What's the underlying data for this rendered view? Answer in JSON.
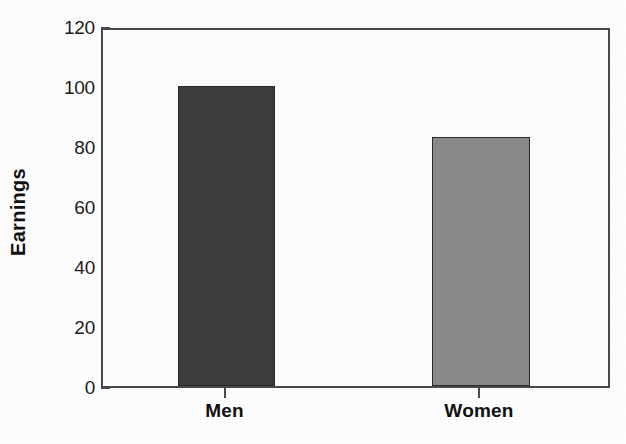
{
  "chart_data": {
    "type": "bar",
    "title": "",
    "subtitle": "",
    "xlabel": "",
    "ylabel": "Earnings",
    "categories": [
      "Men",
      "Women"
    ],
    "values": [
      100,
      83
    ],
    "series": [
      {
        "name": "Earnings",
        "values": [
          100,
          83
        ]
      }
    ],
    "ylim": [
      0,
      120
    ],
    "y_ticks": [
      0,
      20,
      40,
      60,
      80,
      100,
      120
    ],
    "y_tick_labels": [
      "0",
      "20",
      "40",
      "60",
      "80",
      "100",
      "120"
    ],
    "x_tick_labels": [
      "Men",
      "Women"
    ],
    "grid": false,
    "legend": false,
    "legend_position": "none",
    "bar_colors": [
      "#3d3d3d",
      "#8a8a8a"
    ],
    "bar_border_color": "#2a2a2a",
    "axis_color": "#4a4a4a",
    "background_color": "#fdfdfd",
    "text_color": "#111111",
    "annotations": []
  },
  "axes": {
    "y_title": "Earnings",
    "y_ticks": [
      {
        "value": 120,
        "label": "120"
      },
      {
        "value": 100,
        "label": "100"
      },
      {
        "value": 80,
        "label": "80"
      },
      {
        "value": 60,
        "label": "60"
      },
      {
        "value": 40,
        "label": "40"
      },
      {
        "value": 20,
        "label": "20"
      },
      {
        "value": 0,
        "label": "0"
      }
    ],
    "x_ticks": [
      {
        "label": "Men"
      },
      {
        "label": "Women"
      }
    ]
  },
  "bars": [
    {
      "category": "Men",
      "value": 100,
      "color": "#3d3d3d"
    },
    {
      "category": "Women",
      "value": 83,
      "color": "#8a8a8a"
    }
  ]
}
